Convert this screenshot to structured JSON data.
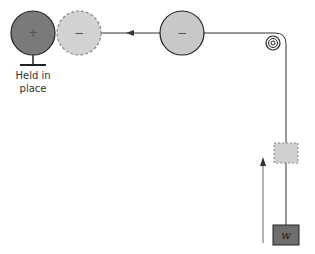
{
  "diagram": {
    "fixed_charge": {
      "sign": "+",
      "label_line1": "Held in",
      "label_line2": "place"
    },
    "ghost_charge": {
      "sign": "−"
    },
    "moving_charge": {
      "sign": "−"
    },
    "weight": {
      "label": "w"
    },
    "colors": {
      "fixed_fill": "#7a7a7a",
      "charge_fill": "#c8c8c8",
      "ghost_fill": "#d2d2d2",
      "weight_fill": "#6e6e6e",
      "ghost_block_fill": "#d0d0d0",
      "line": "#333333"
    }
  }
}
